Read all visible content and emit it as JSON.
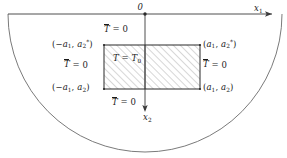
{
  "figure": {
    "domain_shape": "half-disk",
    "colors": {
      "stroke": "#6b6b6b",
      "axis": "#3a3a3a",
      "rect_border": "#2b2b2b",
      "hatch": "#8c8c8c",
      "text": "#1a1a1a",
      "background": "#ffffff"
    }
  },
  "axes": {
    "origin_label": "0",
    "x1_label": "x",
    "x1_sub": "1",
    "x2_label": "x",
    "x2_sub": "2"
  },
  "boundary_conditions": {
    "top": {
      "symbol": "T",
      "rel": " = ",
      "value": "0"
    },
    "left": {
      "symbol": "T",
      "rel": " = ",
      "value": "0"
    },
    "right": {
      "symbol": "T",
      "rel": " = ",
      "value": "0"
    },
    "bottom": {
      "symbol": "T",
      "rel": " = ",
      "value": "0"
    }
  },
  "interior": {
    "symbol": "T",
    "rel": " = ",
    "value": "T",
    "value_sub": "0"
  },
  "corners": {
    "top_left": {
      "open": "(",
      "x": "−a",
      "xsub": "1",
      "sep": ", ",
      "y": "a",
      "ysub": "2",
      "ysup": "*",
      "close": ")"
    },
    "top_right": {
      "open": "(",
      "x": "a",
      "xsub": "1",
      "sep": ", ",
      "y": "a",
      "ysub": "2",
      "ysup": "*",
      "close": ")"
    },
    "bottom_left": {
      "open": "(",
      "x": "−a",
      "xsub": "1",
      "sep": ", ",
      "y": "a",
      "ysub": "2",
      "ysup": "",
      "close": ")"
    },
    "bottom_right": {
      "open": "(",
      "x": "a",
      "xsub": "1",
      "sep": ", ",
      "y": "a",
      "ysub": "2",
      "ysup": "",
      "close": ")"
    }
  },
  "geometry": {
    "rect": {
      "left": 104,
      "top": 45,
      "right": 200,
      "bottom": 89
    },
    "origin": {
      "x": 145,
      "y": 14
    },
    "arc_radius_x": 137,
    "arc_radius_y": 138
  }
}
